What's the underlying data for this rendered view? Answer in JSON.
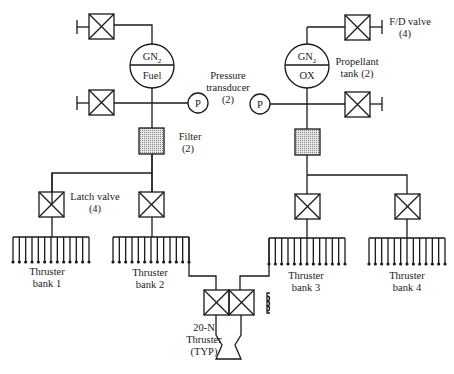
{
  "diagram": {
    "tanks": [
      {
        "top": "GN",
        "top_sub": "2",
        "bottom": "Fuel"
      },
      {
        "top": "GN",
        "top_sub": "2",
        "bottom": "OX"
      }
    ],
    "labels": {
      "pressure_transducer_1": "Pressure",
      "pressure_transducer_2": "transducer",
      "pressure_transducer_3": "(2)",
      "transducer_symbol": "P",
      "filter_1": "Filter",
      "filter_2": "(2)",
      "fd_valve_1": "F/D valve",
      "fd_valve_2": "(4)",
      "propellant_tank_1": "Propellant",
      "propellant_tank_2": "tank (2)",
      "latch_valve_1": "Latch valve",
      "latch_valve_2": "(4)",
      "thruster_20n_1": "20-N",
      "thruster_20n_2": "Thruster",
      "thruster_20n_3": "(TYP)"
    },
    "thruster_banks": [
      {
        "line1": "Thruster",
        "line2": "bank 1"
      },
      {
        "line1": "Thruster",
        "line2": "bank 2"
      },
      {
        "line1": "Thruster",
        "line2": "bank 3"
      },
      {
        "line1": "Thruster",
        "line2": "bank 4"
      }
    ],
    "thrusters_per_bank": 13,
    "colors": {
      "line": "#1a1a1a",
      "filter_fill": "#c8c8c8",
      "background": "#ffffff"
    }
  }
}
